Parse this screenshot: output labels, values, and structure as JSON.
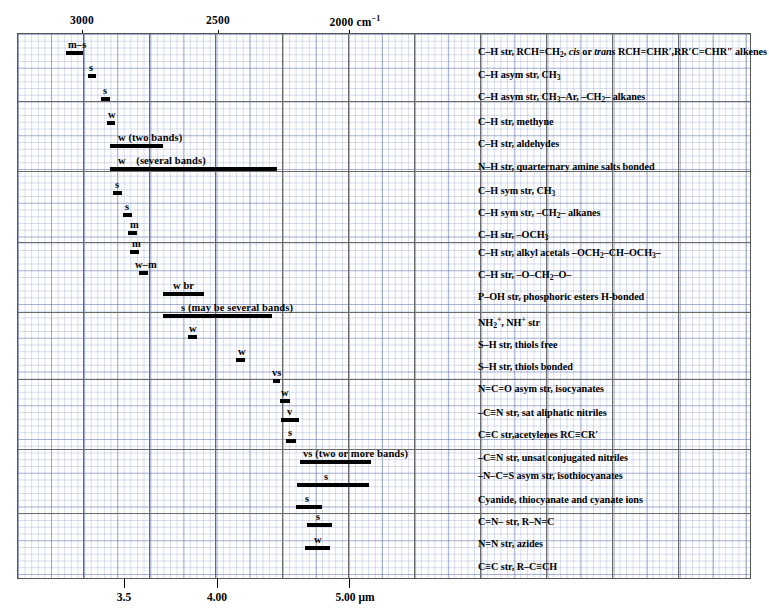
{
  "chart_data": {
    "type": "table",
    "xlabel_top": "cm⁻¹",
    "xlabel_bottom": "μm",
    "top_axis": {
      "unit": "cm-1",
      "ticks": [
        {
          "label": "3000",
          "value": 3000,
          "x": 82
        },
        {
          "label": "2500",
          "value": 2500,
          "x": 218
        },
        {
          "label": "2000 cm⁻¹",
          "value": 2000,
          "x": 349
        }
      ]
    },
    "bottom_axis": {
      "unit": "micrometer",
      "ticks": [
        {
          "label": "3.5",
          "value": 3.5,
          "x": 124
        },
        {
          "label": "4.00",
          "value": 4.0,
          "x": 217
        },
        {
          "label": "5.00 μm",
          "value": 5.0,
          "x": 349
        }
      ]
    },
    "groups": [
      {
        "rows": [
          {
            "intensity": "m–s",
            "label_x": 74,
            "bar_start": 66,
            "bar_end": 83,
            "assignment": "C–H str, RCH=CH<sub>2</sub>, <i>cis</i> or <i>trans</i> RCH=CHR′,RR′C=CHR″ alkenes"
          },
          {
            "intensity": "s",
            "label_x": 91,
            "bar_start": 88,
            "bar_end": 96,
            "assignment": "C–H asym str, CH<sub>3</sub>"
          },
          {
            "intensity": "s",
            "label_x": 105,
            "bar_start": 101,
            "bar_end": 110,
            "assignment": "C–H asym str, CH<sub>3</sub>–Ar, –CH<sub>2</sub>– alkanes"
          }
        ]
      },
      {
        "rows": [
          {
            "intensity": "w",
            "label_x": 110,
            "bar_start": 107,
            "bar_end": 115,
            "assignment": "C–H str, methyne"
          },
          {
            "intensity": "w (two bands)",
            "label_x": 122,
            "bar_start": 110,
            "bar_end": 163,
            "assignment": "C–H str, aldehydes"
          },
          {
            "intensity": "w (several bands)",
            "label_x": 122,
            "bar_start": 110,
            "bar_end": 277,
            "assignment": "N–H str, quarternary amine salts bonded"
          }
        ]
      },
      {
        "rows": [
          {
            "intensity": "s",
            "label_x": 117,
            "bar_start": 113,
            "bar_end": 122,
            "assignment": "C–H sym str, CH<sub>3</sub>"
          },
          {
            "intensity": "s",
            "label_x": 127,
            "bar_start": 123,
            "bar_end": 132,
            "assignment": "C–H sym str, –CH<sub>2</sub>– alkanes"
          },
          {
            "intensity": "m",
            "label_x": 132,
            "bar_start": 128,
            "bar_end": 137,
            "assignment": "C–H str, –OCH<sub>3</sub>"
          },
          {
            "intensity": "m",
            "label_x": 133,
            "bar_start": 130,
            "bar_end": 138,
            "assignment": "C–H str, alkyl acetals –OCH<sub>2</sub>–CH–OCH<sub>3</sub>–"
          }
        ]
      },
      {
        "rows": [
          {
            "intensity": "w–m",
            "label_x": 140,
            "bar_start": 139,
            "bar_end": 147,
            "assignment": "C–H str, –O–CH<sub>2</sub>–O–"
          },
          {
            "intensity": "w br",
            "label_x": 180,
            "bar_start": 163,
            "bar_end": 204,
            "assignment": "P–OH str, phosphoric esters H-bonded"
          },
          {
            "intensity": "s (may be several bands)",
            "label_x": 203,
            "bar_start": 163,
            "bar_end": 272,
            "assignment": "NH<sub>2</sub><sup>+</sup>, NH<sup>+</sup> str"
          }
        ]
      },
      {
        "rows": [
          {
            "intensity": "w",
            "label_x": 192,
            "bar_start": 188,
            "bar_end": 197,
            "assignment": "S–H str, thiols free"
          },
          {
            "intensity": "w",
            "label_x": 240,
            "bar_start": 236,
            "bar_end": 245,
            "assignment": "S–H str, thiols bonded"
          },
          {
            "intensity": "vs",
            "label_x": 276,
            "bar_start": 273,
            "bar_end": 280,
            "assignment": "N=C=O asym str, isocyanates"
          }
        ]
      },
      {
        "rows": [
          {
            "intensity": "w",
            "label_x": 285,
            "bar_start": 280,
            "bar_end": 290,
            "assignment": "–C≡N str, sat aliphatic nitriles"
          },
          {
            "intensity": "v",
            "label_x": 290,
            "bar_start": 281,
            "bar_end": 299,
            "assignment": "C≡C str,acetylenes RC≡CR′"
          },
          {
            "intensity": "s",
            "label_x": 291,
            "bar_start": 286,
            "bar_end": 296,
            "assignment": "–C≡N str, unsat conjugated nitriles"
          },
          {
            "intensity": "vs (two or more bands)",
            "label_x": 349,
            "bar_start": 300,
            "bar_end": 371,
            "assignment": "–N–C=S asym str, isothiocyanates"
          }
        ]
      },
      {
        "rows": [
          {
            "intensity": "s",
            "label_x": 327,
            "bar_start": 297,
            "bar_end": 369,
            "assignment": "Cyanide, thiocyanate and cyanate ions"
          },
          {
            "intensity": "s",
            "label_x": 308,
            "bar_start": 296,
            "bar_end": 322,
            "assignment": "C=N– str, R–N=C"
          },
          {
            "intensity": "s",
            "label_x": 318,
            "bar_start": 307,
            "bar_end": 332,
            "assignment": "N=N str, azides"
          }
        ]
      },
      {
        "rows": [
          {
            "intensity": "w",
            "label_x": 316,
            "bar_start": 305,
            "bar_end": 330,
            "assignment": "C≡C str, R–C≡CH"
          }
        ]
      }
    ]
  }
}
